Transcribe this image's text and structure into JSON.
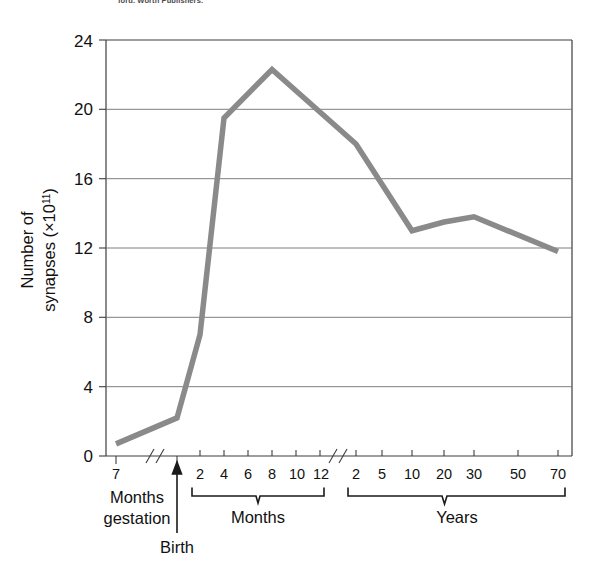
{
  "figure": {
    "top_credit": "ford. Worth Publishers.",
    "line_color": "#8a8a8a",
    "grid_color": "#6f6f6f",
    "axis_color": "#3d3d3d"
  },
  "chart_data": {
    "type": "line",
    "title": "",
    "ylabel_line1": "Number of",
    "ylabel_line2_prefix": "synapses (×10",
    "ylabel_line2_sup": "11",
    "ylabel_line2_suffix": ")",
    "ylabel_full": "Number of synapses (×10¹¹)",
    "xlabel": "",
    "ylim": [
      0,
      24
    ],
    "y_ticks": [
      "0",
      "4",
      "8",
      "12",
      "16",
      "20",
      "24"
    ],
    "grid": "horizontal",
    "legend": "none",
    "axis_breaks": 2,
    "x_segments": [
      {
        "name": "Months gestation",
        "group_label_line1": "Months",
        "group_label_line2": "gestation",
        "tick_labels": [
          "7"
        ]
      },
      {
        "name": "Months",
        "group_label": "Months",
        "tick_labels": [
          "2",
          "4",
          "6",
          "8",
          "10",
          "12"
        ]
      },
      {
        "name": "Years",
        "group_label": "Years",
        "tick_labels": [
          "2",
          "5",
          "10",
          "20",
          "30",
          "50",
          "70"
        ]
      }
    ],
    "annotations": [
      {
        "name": "birth-marker",
        "label": "Birth"
      }
    ],
    "points": [
      {
        "x_label": "7 months gestation",
        "value": 0.7
      },
      {
        "x_label": "Birth",
        "value": 2.2
      },
      {
        "x_label": "2 months",
        "value": 7.0
      },
      {
        "x_label": "4 months",
        "value": 19.5
      },
      {
        "x_label": "8 months",
        "value": 22.3
      },
      {
        "x_label": "2 years",
        "value": 18.0
      },
      {
        "x_label": "10 years",
        "value": 13.0
      },
      {
        "x_label": "20 years",
        "value": 13.5
      },
      {
        "x_label": "30 years",
        "value": 13.8
      },
      {
        "x_label": "70 years",
        "value": 11.8
      }
    ]
  }
}
